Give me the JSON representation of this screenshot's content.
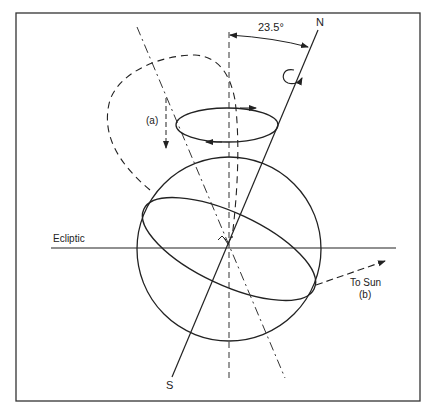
{
  "figure": {
    "labels": {
      "north": "N",
      "south": "S",
      "tilt_angle": "23.5°",
      "ecliptic": "Ecliptic",
      "to_sun": "To Sun",
      "label_a": "(a)",
      "label_b": "(b)"
    },
    "colors": {
      "stroke": "#222222",
      "frame": "#333333",
      "background": "#ffffff"
    }
  }
}
